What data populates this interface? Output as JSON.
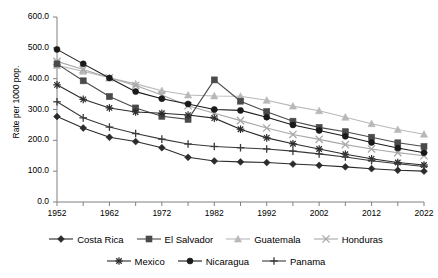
{
  "chart_data": {
    "type": "line",
    "title": "",
    "subtitle": "",
    "xlabel": "",
    "ylabel": "Rate per 1000 pop.",
    "xlim": [
      1952,
      2022
    ],
    "ylim": [
      0,
      600
    ],
    "grid": false,
    "legend_position": "bottom",
    "x": [
      1952,
      1957,
      1962,
      1967,
      1972,
      1977,
      1982,
      1987,
      1992,
      1997,
      2002,
      2007,
      2012,
      2017,
      2022
    ],
    "xticks": [
      "1952",
      "1962",
      "1972",
      "1982",
      "1992",
      "2002",
      "2012",
      "2022"
    ],
    "yticks": [
      "0.0",
      "100.0",
      "200.0",
      "300.0",
      "400.0",
      "500.0",
      "600.0"
    ],
    "series": [
      {
        "name": "Costa Rica",
        "marker": "diamond",
        "color": "#2b2b2b",
        "values": [
          277,
          240,
          210,
          196,
          176,
          145,
          133,
          130,
          128,
          123,
          119,
          114,
          108,
          103,
          100
        ]
      },
      {
        "name": "El Salvador",
        "marker": "square",
        "color": "#4a4a4a",
        "values": [
          448,
          393,
          342,
          305,
          278,
          268,
          396,
          327,
          293,
          262,
          242,
          228,
          210,
          192,
          180
        ]
      },
      {
        "name": "Guatemala",
        "marker": "triangle",
        "color": "#b8b8b8",
        "values": [
          443,
          424,
          403,
          383,
          361,
          347,
          344,
          343,
          330,
          311,
          296,
          275,
          254,
          235,
          220
        ]
      },
      {
        "name": "Honduras",
        "marker": "x",
        "color": "#a8a8a8",
        "values": [
          456,
          430,
          403,
          378,
          347,
          312,
          288,
          264,
          240,
          219,
          203,
          186,
          172,
          160,
          150
        ]
      },
      {
        "name": "Mexico",
        "marker": "asterisk",
        "color": "#2b2b2b",
        "values": [
          380,
          333,
          305,
          292,
          288,
          282,
          272,
          236,
          208,
          189,
          172,
          155,
          140,
          128,
          120
        ]
      },
      {
        "name": "Nicaragua",
        "marker": "circle",
        "color": "#1a1a1a",
        "values": [
          495,
          448,
          402,
          358,
          335,
          318,
          300,
          297,
          275,
          250,
          232,
          213,
          193,
          175,
          160
        ]
      },
      {
        "name": "Panama",
        "marker": "plus",
        "color": "#3a3a3a",
        "values": [
          325,
          273,
          243,
          222,
          204,
          188,
          180,
          176,
          172,
          165,
          156,
          146,
          134,
          124,
          115
        ]
      }
    ]
  },
  "legend": {
    "row1": [
      "Costa Rica",
      "El Salvador",
      "Guatemala",
      "Honduras"
    ],
    "row2": [
      "Mexico",
      "Nicaragua",
      "Panama"
    ]
  },
  "axis": {
    "y_title": "Rate per 1000 pop."
  }
}
